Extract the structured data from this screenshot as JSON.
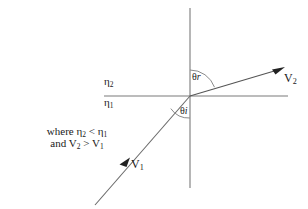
{
  "figure": {
    "background_color": "#ffffff",
    "line_color": "#6b6b6b",
    "ray_color": "#5a5a5a",
    "text_color": "#1a1a1a",
    "width": 308,
    "height": 209
  },
  "axes": {
    "normal_line_name": "normal-line",
    "interface_line_name": "interface-line",
    "origin_x": 190,
    "origin_y": 96
  },
  "labels": {
    "eta_upper": "η",
    "eta_upper_sub": "2",
    "eta_lower": "η",
    "eta_lower_sub": "1",
    "theta_r": "θ",
    "theta_r_sub": "r",
    "theta_i": "θ",
    "theta_i_sub": "i",
    "v_refracted": "V",
    "v_refracted_sub": "2",
    "v_incident": "V",
    "v_incident_sub": "1"
  },
  "note": {
    "line1_prefix": "where ",
    "line1_eta2": "η",
    "line1_eta2_sub": "2",
    "line1_relation": " < ",
    "line1_eta1": "η",
    "line1_eta1_sub": "1",
    "line2_prefix": "and ",
    "line2_v2": "V",
    "line2_v2_sub": "2",
    "line2_relation": " > ",
    "line2_v1": "V",
    "line2_v1_sub": "1"
  },
  "geometry": {
    "normal": {
      "x": 190,
      "y_top": 8,
      "y_bottom": 188
    },
    "interface": {
      "y": 96,
      "x_left": 104,
      "x_right": 288
    },
    "refracted_ray": {
      "x1": 190,
      "y1": 96,
      "x2": 284,
      "y2": 68
    },
    "incident_ray": {
      "x1": 95,
      "y1": 205,
      "x2": 190,
      "y2": 96
    },
    "arc_theta_r_radius": 26,
    "arc_theta_i_radius": 22,
    "arrow_v2_tip": {
      "x": 284,
      "y": 68
    },
    "arrow_v1_tip": {
      "x": 128,
      "y": 159
    }
  }
}
